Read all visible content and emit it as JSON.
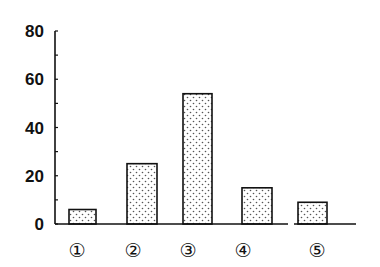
{
  "chart_data": {
    "type": "bar",
    "title": "",
    "xlabel": "",
    "ylabel": "",
    "categories": [
      "①",
      "②",
      "③",
      "④",
      "⑤"
    ],
    "values": [
      6,
      25,
      54,
      15,
      9
    ],
    "ylim": [
      0,
      80
    ],
    "yticks": [
      0,
      20,
      40,
      60,
      80
    ],
    "ytick_labels": [
      "0",
      "20",
      "40",
      "60",
      "80"
    ],
    "minor_tick_step": 10,
    "grid": false,
    "legend": null,
    "bar_fill": "dotted",
    "colors": {
      "bar_stroke": "#111111",
      "dot": "#555555",
      "axis": "#111111",
      "background": "#ffffff"
    }
  }
}
